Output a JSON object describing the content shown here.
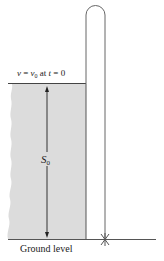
{
  "diagram": {
    "labels": {
      "initial_condition": {
        "v": "v",
        "eq1": " = ",
        "v0": "v",
        "v0_sub": "0",
        "at": " at ",
        "t": "t",
        "eq2": " = 0"
      },
      "height": {
        "symbol": "S",
        "subscript": "0"
      },
      "ground": "Ground level"
    },
    "colors": {
      "building_fill": "#dcdcdc",
      "line": "#555555",
      "trajectory": "#666666",
      "text": "#222222"
    },
    "elements": {
      "building": "Gray building with rough left edge, top at initial height",
      "trajectory": "Vertical up-and-down path: rises from building top, arcs over, falls to ground",
      "height_arrow": "Double-headed arrow spanning building height S0",
      "impact_marker": "Star mark at ground impact point"
    }
  }
}
